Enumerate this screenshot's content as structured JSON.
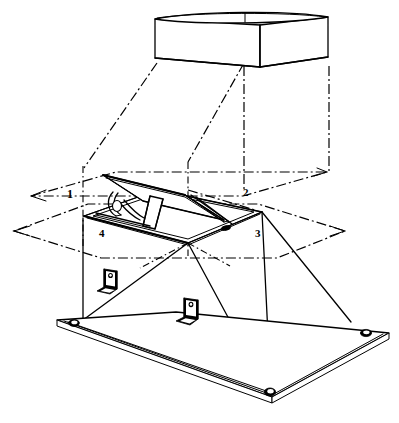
{
  "figure": {
    "kind": "technical-assembly-line-drawing",
    "background_color": "#ffffff",
    "line_color": "#000000",
    "projection": "isometric exploded view"
  },
  "callouts": [
    {
      "id": "callout-1",
      "label": "1",
      "x": 69,
      "y": 189,
      "note": "upper phantom plane / duct outlet plane"
    },
    {
      "id": "callout-2",
      "label": "2",
      "x": 245,
      "y": 189,
      "note": "damper frame plane"
    },
    {
      "id": "callout-3",
      "label": "3",
      "x": 257,
      "y": 231,
      "note": "lower phantom plane / curb opening plane"
    },
    {
      "id": "callout-4",
      "label": "4",
      "x": 101,
      "y": 231,
      "note": "damper blade / frame assembly"
    }
  ],
  "parts": [
    {
      "name": "top-duct-box",
      "description": "rectangular duct collar drawn in solid outline at top"
    },
    {
      "name": "projection-lines",
      "description": "dash-dot phantom projection lines from duct box down to frame planes"
    },
    {
      "name": "upper-phantom-plane",
      "description": "dash-dot parallelogram indicating upper reference plane"
    },
    {
      "name": "lower-phantom-plane",
      "description": "dash-dot parallelogram indicating lower reference plane"
    },
    {
      "name": "damper-frame",
      "description": "rectangular damper frame with open pivoting blade and actuator arm"
    },
    {
      "name": "damper-blade",
      "description": "hinged damper blade shown in open position"
    },
    {
      "name": "actuator-arm",
      "description": "angled support / linkage arm on the damper"
    },
    {
      "name": "hood-housing",
      "description": "tapered sheet-metal transition housing from frame to base plate"
    },
    {
      "name": "base-plate",
      "description": "flat rectangular mounting flange plate"
    },
    {
      "name": "mounting-hole",
      "description": "oval mounting hole at each base plate corner",
      "count": 3
    },
    {
      "name": "angle-bracket",
      "description": "L-shaped mounting angle bracket with fastener hole",
      "count": 2
    },
    {
      "name": "rivet-detail",
      "description": "small dark fastener detail on frame near callout 3"
    }
  ],
  "colors": {
    "stroke": "#000000",
    "fill": "#ffffff",
    "paper": "#ffffff"
  }
}
